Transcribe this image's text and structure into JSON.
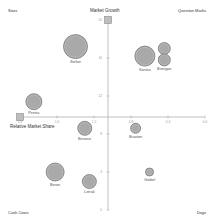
{
  "chart_data": {
    "type": "scatter",
    "subtype": "bubble",
    "title": "",
    "xlabel": "Relative Market Share",
    "ylabel": "Market Growth",
    "x_axis_reversed": true,
    "xlim": [
      2.0,
      0.0
    ],
    "ylim": [
      0,
      20
    ],
    "x_ticks": [
      "2.0",
      "1.6",
      "1.2",
      "0.8",
      "0.4",
      "0.0"
    ],
    "y_ticks": [
      "20",
      "16",
      "12",
      "8",
      "4",
      "0"
    ],
    "x_split": 1.0,
    "y_split": 10,
    "grid": false,
    "quadrants": {
      "top_left": "Stars",
      "top_right": "Question Marks",
      "bottom_left": "Cash Cows",
      "bottom_right": "Dogs"
    },
    "points": [
      {
        "name": "Stefan",
        "x": 1.4,
        "y": 17.2,
        "size": 12
      },
      {
        "name": "Pentra",
        "x": 1.85,
        "y": 11.4,
        "size": 8
      },
      {
        "name": "Santos",
        "x": 0.65,
        "y": 16.2,
        "size": 10
      },
      {
        "name": "Longat",
        "x": 0.44,
        "y": 17.0,
        "size": 6
      },
      {
        "name": "Brengan",
        "x": 0.44,
        "y": 15.8,
        "size": 6
      },
      {
        "name": "Benosic",
        "x": 1.3,
        "y": 8.6,
        "size": 7
      },
      {
        "name": "Braxton",
        "x": 0.75,
        "y": 8.6,
        "size": 5
      },
      {
        "name": "Boron",
        "x": 1.62,
        "y": 4.0,
        "size": 9
      },
      {
        "name": "Lotrak",
        "x": 1.25,
        "y": 3.0,
        "size": 7
      },
      {
        "name": "Giobel",
        "x": 0.6,
        "y": 4.0,
        "size": 4
      }
    ],
    "colors": {
      "bubble_fill": "#a9a9a9",
      "bubble_stroke": "#777777",
      "axis": "#b0b0b0",
      "text": "#333333"
    }
  }
}
